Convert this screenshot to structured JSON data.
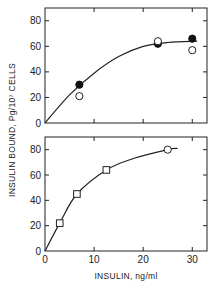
{
  "chart_data": [
    {
      "type": "scatter",
      "panel": "top",
      "title": "",
      "xlabel": "",
      "ylabel": "INSULIN BOUND, Pg/10^7 CELLS",
      "xlim": [
        0,
        33
      ],
      "ylim": [
        0,
        90
      ],
      "yticks": [
        0,
        20,
        40,
        60,
        80
      ],
      "xticks": [
        0,
        10,
        20,
        30
      ],
      "grid": false,
      "series": [
        {
          "name": "filled circles",
          "marker": "filled-circle",
          "x": [
            7,
            23,
            30
          ],
          "y": [
            30,
            62,
            66
          ]
        },
        {
          "name": "open circles",
          "marker": "open-circle",
          "x": [
            7,
            23,
            30
          ],
          "y": [
            21,
            64,
            57
          ]
        },
        {
          "name": "fit curve",
          "marker": "line",
          "x": [
            0,
            5,
            10,
            15,
            20,
            25,
            31
          ],
          "y": [
            0,
            22,
            39,
            52,
            60,
            63,
            64
          ]
        }
      ]
    },
    {
      "type": "scatter",
      "panel": "bottom",
      "title": "",
      "xlabel": "INSULIN, ng/ml",
      "ylabel": "INSULIN BOUND, Pg/10^7 CELLS",
      "xlim": [
        0,
        33
      ],
      "ylim": [
        0,
        90
      ],
      "yticks": [
        0,
        20,
        40,
        60,
        80
      ],
      "xticks": [
        0,
        10,
        20,
        30
      ],
      "grid": false,
      "series": [
        {
          "name": "open squares",
          "marker": "open-square",
          "x": [
            3,
            6.5,
            12.5
          ],
          "y": [
            22,
            45,
            64
          ]
        },
        {
          "name": "open circle",
          "marker": "open-circle",
          "x": [
            25
          ],
          "y": [
            80
          ]
        },
        {
          "name": "fit curve",
          "marker": "line",
          "x": [
            0,
            3,
            6.5,
            12.5,
            18,
            25,
            27
          ],
          "y": [
            0,
            22,
            45,
            64,
            73,
            80,
            81
          ]
        }
      ]
    }
  ],
  "labels": {
    "ylabel": "INSULIN BOUND,  Pg/10⁷  CELLS",
    "xlabel": "INSULIN,  ng/ml",
    "yticks": [
      "0",
      "20",
      "40",
      "60",
      "80"
    ],
    "xticks": [
      "0",
      "10",
      "20",
      "30"
    ]
  }
}
